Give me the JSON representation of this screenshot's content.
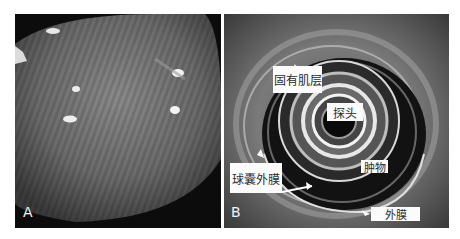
{
  "figure": {
    "panels": [
      {
        "id": "A",
        "letter": "A",
        "description": "Endoscopic view of smooth bulging submucosal lesion"
      },
      {
        "id": "B",
        "letter": "B",
        "description": "Endoscopic ultrasound cross-section",
        "annotations": {
          "muscularis_propria": "固有肌层",
          "probe": "探头",
          "mass": "肿物",
          "balloon_membrane": "球囊外膜",
          "adventitia": "外膜"
        }
      }
    ]
  }
}
